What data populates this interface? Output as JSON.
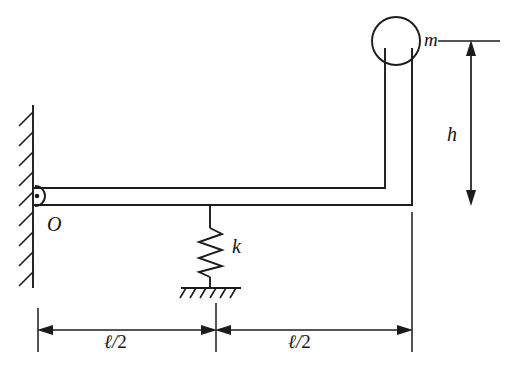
{
  "figure": {
    "type": "free-body-mechanism-diagram",
    "background_color": "#ffffff",
    "line_color": "#1b1b1b"
  },
  "labels": {
    "mass": "m",
    "height": "h",
    "spring_constant": "k",
    "pivot": "O",
    "length_left": "ℓ/2",
    "length_right": "ℓ/2",
    "length_left_parts": {
      "symbol": "ℓ",
      "slash": "/",
      "denominator": "2"
    },
    "length_right_parts": {
      "symbol": "ℓ",
      "slash": "/",
      "denominator": "2"
    }
  },
  "elements": {
    "wall": {
      "name": "fixed-wall",
      "hatch_count": 9,
      "x": 33,
      "y_top": 105,
      "y_bottom": 288
    },
    "pivot": {
      "name": "pin-support",
      "cx": 35,
      "cy": 196,
      "r": 10,
      "dot_r": 2.2
    },
    "beam": {
      "name": "horizontal-beam",
      "x_start": 33,
      "x_end": 412,
      "y_top": 188,
      "y_bottom": 205
    },
    "riser": {
      "name": "vertical-riser",
      "x_left": 385,
      "x_right": 412,
      "y_top": 45,
      "y_bottom": 205
    },
    "mass_circle": {
      "name": "tip-mass",
      "cx": 396,
      "cy": 41,
      "r": 24
    },
    "spring": {
      "name": "coil-spring",
      "x": 210,
      "y_top": 205,
      "y_bottom": 288,
      "coils": 6
    },
    "ground": {
      "name": "spring-ground-support",
      "x_left": 181,
      "x_right": 241,
      "y": 288,
      "hatch_count": 6
    },
    "height_dimension": {
      "name": "h-dimension",
      "x": 471,
      "y_top": 41,
      "y_bottom": 204,
      "double_headed": true
    },
    "height_tick": {
      "name": "mass-level-tick",
      "x_start": 438,
      "x_end": 500,
      "y": 41
    },
    "length_dimension": {
      "name": "length-dimension-line",
      "y": 330,
      "x_left": 38,
      "x_mid": 216,
      "x_right": 412
    }
  }
}
